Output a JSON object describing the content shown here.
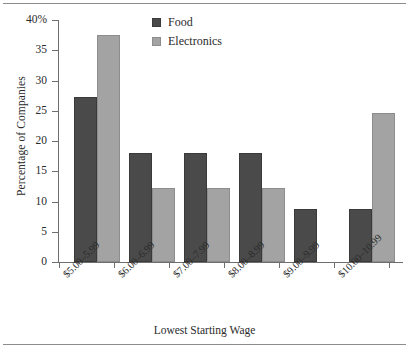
{
  "chart_data": {
    "type": "bar",
    "title": "",
    "xlabel": "Lowest Starting Wage",
    "ylabel": "Percentage of Companies",
    "categories": [
      "$5.00–5.99",
      "$6.00–6.99",
      "$7.00–7.99",
      "$8.00–8.99",
      "$9.00–9.99",
      "$10.00–10.99"
    ],
    "series": [
      {
        "name": "Food",
        "color": "#4a4a4a",
        "values": [
          27.3,
          18.0,
          18.0,
          18.0,
          8.8,
          8.8
        ]
      },
      {
        "name": "Electronics",
        "color": "#a3a3a3",
        "values": [
          37.5,
          12.2,
          12.2,
          12.2,
          0,
          24.6
        ]
      }
    ],
    "ylim": [
      0,
      40
    ],
    "ytick_values": [
      0,
      5,
      10,
      15,
      20,
      25,
      30,
      35,
      40
    ],
    "ytick_labels": [
      "0",
      "5",
      "10",
      "15",
      "20",
      "25",
      "30",
      "35",
      "40%"
    ],
    "grid": false,
    "legend_position": "top-center"
  },
  "legend": {
    "entries": [
      {
        "label": "Food"
      },
      {
        "label": "Electronics"
      }
    ]
  },
  "axes": {
    "y_title": "Percentage of Companies",
    "x_title": "Lowest Starting Wage"
  }
}
